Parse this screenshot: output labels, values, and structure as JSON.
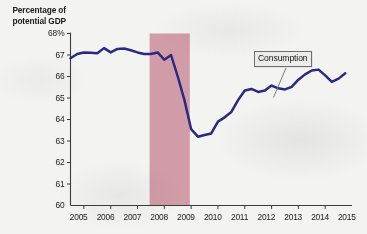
{
  "chart_data": {
    "type": "line",
    "title": "",
    "subtitle": "",
    "ylabel": "Percentage of potential GDP",
    "xlabel": "",
    "ylim": [
      60,
      68
    ],
    "xlim": [
      2005,
      2015.5
    ],
    "grid": false,
    "legend_position": "inline-annotation",
    "y_tick_labels": [
      "68%",
      "67",
      "66",
      "65",
      "64",
      "63",
      "62",
      "61",
      "60"
    ],
    "y_tick_values": [
      68,
      67,
      66,
      65,
      64,
      63,
      62,
      61,
      60
    ],
    "x_tick_labels": [
      "2005",
      "2006",
      "2007",
      "2008",
      "2009",
      "2010",
      "2011",
      "2012",
      "2013",
      "2014",
      "2015"
    ],
    "x_tick_values": [
      2005,
      2006,
      2007,
      2008,
      2009,
      2010,
      2011,
      2012,
      2013,
      2014,
      2015
    ],
    "annotations": [
      {
        "text": "Consumption",
        "kind": "series-label-with-leader-line"
      }
    ],
    "shaded_regions": [
      {
        "label": "recession",
        "x_start": 2007.95,
        "x_end": 2009.45,
        "color": "#d19ca8"
      }
    ],
    "series": [
      {
        "name": "Consumption",
        "color": "#2a2a80",
        "x": [
          2005.0,
          2005.25,
          2005.5,
          2005.75,
          2006.0,
          2006.25,
          2006.5,
          2006.75,
          2007.0,
          2007.25,
          2007.5,
          2007.75,
          2008.0,
          2008.25,
          2008.5,
          2008.75,
          2009.0,
          2009.25,
          2009.5,
          2009.75,
          2010.0,
          2010.25,
          2010.5,
          2010.75,
          2011.0,
          2011.25,
          2011.5,
          2011.75,
          2012.0,
          2012.25,
          2012.5,
          2012.75,
          2013.0,
          2013.25,
          2013.5,
          2013.75,
          2014.0,
          2014.25,
          2014.5,
          2014.75,
          2015.0,
          2015.25
        ],
        "values": [
          66.85,
          67.05,
          67.12,
          67.1,
          67.08,
          67.32,
          67.12,
          67.28,
          67.3,
          67.22,
          67.12,
          67.05,
          67.05,
          67.12,
          66.78,
          67.0,
          66.0,
          64.9,
          63.55,
          63.2,
          63.28,
          63.35,
          63.9,
          64.1,
          64.35,
          64.9,
          65.35,
          65.42,
          65.28,
          65.35,
          65.58,
          65.45,
          65.4,
          65.52,
          65.85,
          66.1,
          66.28,
          66.32,
          66.05,
          65.75,
          65.9,
          66.15
        ]
      }
    ]
  }
}
